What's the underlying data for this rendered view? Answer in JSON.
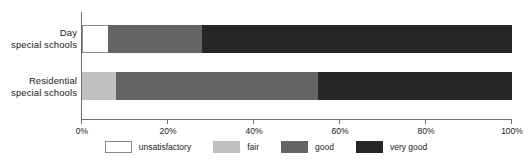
{
  "chart_data": {
    "type": "bar",
    "orientation": "horizontal",
    "stacked": true,
    "stack_mode": "percent",
    "title": "",
    "subtitle": "",
    "xlabel": "",
    "ylabel": "",
    "xlim": [
      0,
      100
    ],
    "xticks": [
      0,
      20,
      40,
      60,
      80,
      100
    ],
    "xtick_labels": [
      "0%",
      "20%",
      "40%",
      "60%",
      "80%",
      "100%"
    ],
    "grid": false,
    "legend_position": "bottom",
    "categories": [
      "Day special schools",
      "Residential special schools"
    ],
    "category_lines": [
      [
        "Day",
        "special schools"
      ],
      [
        "Residential",
        "special schools"
      ]
    ],
    "series": [
      {
        "name": "unsatisfactory",
        "color": "#ffffff",
        "values": [
          6,
          0
        ]
      },
      {
        "name": "fair",
        "color": "#c0c0c0",
        "values": [
          0,
          8
        ]
      },
      {
        "name": "good",
        "color": "#646464",
        "values": [
          22,
          47
        ]
      },
      {
        "name": "very good",
        "color": "#262626",
        "values": [
          72,
          45
        ]
      }
    ],
    "legend_entries": [
      "unsatisfactory",
      "fair",
      "good",
      "very good"
    ]
  },
  "axis": {
    "tick_0": "0%",
    "tick_1": "20%",
    "tick_2": "40%",
    "tick_3": "60%",
    "tick_4": "80%",
    "tick_5": "100%"
  },
  "categories": {
    "day": {
      "line1": "Day",
      "line2": "special schools"
    },
    "residential": {
      "line1": "Residential",
      "line2": "special schools"
    }
  },
  "legend": {
    "unsatisfactory": "unsatisfactory",
    "fair": "fair",
    "good": "good",
    "very_good": "very good"
  },
  "colors": {
    "unsatisfactory": "#ffffff",
    "fair": "#c0c0c0",
    "good": "#646464",
    "very_good": "#262626",
    "axis": "#6e6e6e",
    "text": "#1a1a1a",
    "background": "#ffffff"
  }
}
